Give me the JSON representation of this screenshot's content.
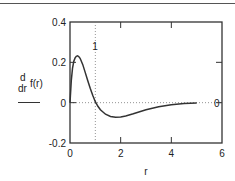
{
  "chart_data": {
    "type": "line",
    "title": "",
    "xlabel": "r",
    "ylabel": {
      "numerator": "d",
      "denominator": "dr",
      "function": "f(r)"
    },
    "xlim": [
      0,
      6
    ],
    "ylim": [
      -0.2,
      0.4
    ],
    "x_ticks": [
      "0",
      "2",
      "4",
      "6"
    ],
    "y_ticks": [
      "-0.2",
      "0",
      "0.2",
      "0.4"
    ],
    "markers": {
      "vertical_x": 1,
      "vertical_label": "1",
      "horizontal_y": 0,
      "horizontal_label": "0"
    },
    "series": [
      {
        "name": "d/dr f(r)",
        "x": [
          0,
          0.05,
          0.1,
          0.15,
          0.2,
          0.25,
          0.3,
          0.35,
          0.4,
          0.5,
          0.6,
          0.7,
          0.8,
          0.9,
          1.0,
          1.1,
          1.2,
          1.4,
          1.6,
          1.8,
          2.0,
          2.2,
          2.5,
          3.0,
          3.5,
          4.0,
          4.5,
          5.0
        ],
        "y": [
          0.0,
          0.11,
          0.17,
          0.205,
          0.222,
          0.23,
          0.232,
          0.228,
          0.22,
          0.19,
          0.15,
          0.11,
          0.07,
          0.035,
          0.005,
          -0.018,
          -0.035,
          -0.057,
          -0.068,
          -0.072,
          -0.071,
          -0.066,
          -0.055,
          -0.035,
          -0.02,
          -0.01,
          -0.004,
          -0.002
        ]
      }
    ]
  }
}
